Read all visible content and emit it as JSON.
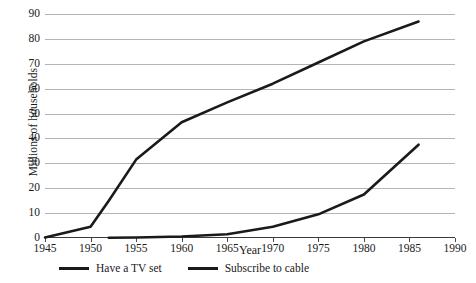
{
  "chart_data": {
    "type": "line",
    "title": "",
    "xlabel": "Year",
    "ylabel": "Millions of households",
    "xlim": [
      1945,
      1990
    ],
    "ylim": [
      0,
      90
    ],
    "xticks": [
      1945,
      1950,
      1955,
      1960,
      1965,
      1970,
      1975,
      1980,
      1985,
      1990
    ],
    "yticks": [
      0,
      10,
      20,
      30,
      40,
      50,
      60,
      70,
      80,
      90
    ],
    "grid": "horizontal",
    "legend_position": "below",
    "line_color": "#1a1a1a",
    "gridline_color": "#b4b4b4",
    "background": "#ffffff",
    "series": [
      {
        "name": "Have a TV set",
        "x": [
          1945,
          1950,
          1952,
          1955,
          1960,
          1965,
          1970,
          1975,
          1980,
          1986
        ],
        "values": [
          0.2,
          4.5,
          15,
          31.5,
          46.5,
          54.5,
          62,
          70.5,
          79,
          87
        ]
      },
      {
        "name": "Subscribe to cable",
        "x": [
          1952,
          1955,
          1960,
          1965,
          1970,
          1975,
          1980,
          1986
        ],
        "values": [
          0.1,
          0.2,
          0.6,
          1.5,
          4.5,
          9.5,
          17.5,
          37.5
        ]
      }
    ]
  },
  "axes": {
    "y_title": "Millions of households",
    "x_title": "Year",
    "y_tick_labels": [
      "90",
      "80",
      "70",
      "60",
      "50",
      "40",
      "30",
      "20",
      "10",
      "0"
    ],
    "x_tick_labels": [
      "1945",
      "1950",
      "1955",
      "1960",
      "1965",
      "1970",
      "1975",
      "1980",
      "1985",
      "1990"
    ]
  },
  "legend": {
    "entries": [
      {
        "label": "Have a TV set"
      },
      {
        "label": "Subscribe to cable"
      }
    ]
  }
}
